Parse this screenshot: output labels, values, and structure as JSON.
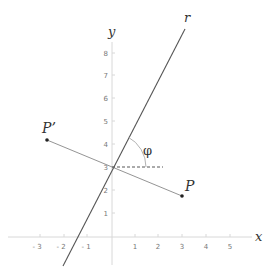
{
  "diagram": {
    "axes": {
      "x_label": "x",
      "y_label": "y",
      "x_ticks": [
        "- 3",
        "- 2",
        "- 1",
        "1",
        "2",
        "3",
        "4",
        "5"
      ],
      "y_ticks": [
        "1",
        "2",
        "3",
        "4",
        "5",
        "6",
        "7",
        "8"
      ]
    },
    "line": {
      "label": "r",
      "slope": 1.9,
      "y_intercept": 3
    },
    "points": {
      "P": {
        "label": "P",
        "x": 3.0,
        "y": 1.8
      },
      "P_prime": {
        "label": "P’",
        "x": -2.8,
        "y": 4.2
      }
    },
    "angle": {
      "label": "φ",
      "approx_degrees": 62
    },
    "colors": {
      "axis": "#dddddd",
      "line": "#555555",
      "segment": "#888888",
      "text": "#333333"
    }
  }
}
